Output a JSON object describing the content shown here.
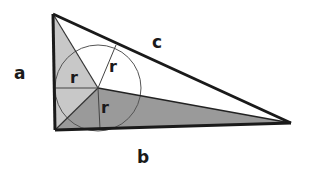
{
  "diagram": {
    "vertices": {
      "A_top": [
        53,
        14
      ],
      "B_right_angle": [
        55,
        130
      ],
      "C_right": [
        291,
        123
      ]
    },
    "incenter": [
      98,
      88
    ],
    "radius_px": 43,
    "tangent_points": {
      "on_a": [
        55,
        88
      ],
      "on_b": [
        99,
        129
      ],
      "on_c": [
        112,
        46
      ]
    },
    "colors": {
      "light_region": "#c8c8c8",
      "dark_region": "#9a9a9a",
      "white_region": "#ffffff",
      "outline": "#1a1a1a",
      "thin_line": "#444444"
    },
    "labels": {
      "side_a": "a",
      "side_b": "b",
      "side_c": "c",
      "radius_on_a": "r",
      "radius_on_c": "r",
      "radius_on_b": "r"
    }
  }
}
